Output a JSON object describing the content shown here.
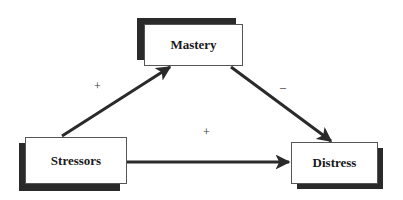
{
  "diagram": {
    "type": "mediation-path-model",
    "nodes": [
      {
        "id": "mastery",
        "label": "Mastery"
      },
      {
        "id": "stressors",
        "label": "Stressors"
      },
      {
        "id": "distress",
        "label": "Distress"
      }
    ],
    "edges": [
      {
        "from": "stressors",
        "to": "mastery",
        "sign": "+"
      },
      {
        "from": "mastery",
        "to": "distress",
        "sign": "–"
      },
      {
        "from": "stressors",
        "to": "distress",
        "sign": "+"
      }
    ]
  },
  "colors": {
    "line": "#2a2a2a",
    "shadow": "#2a2a2a",
    "box_border": "#555555",
    "text": "#1a1a1a"
  }
}
